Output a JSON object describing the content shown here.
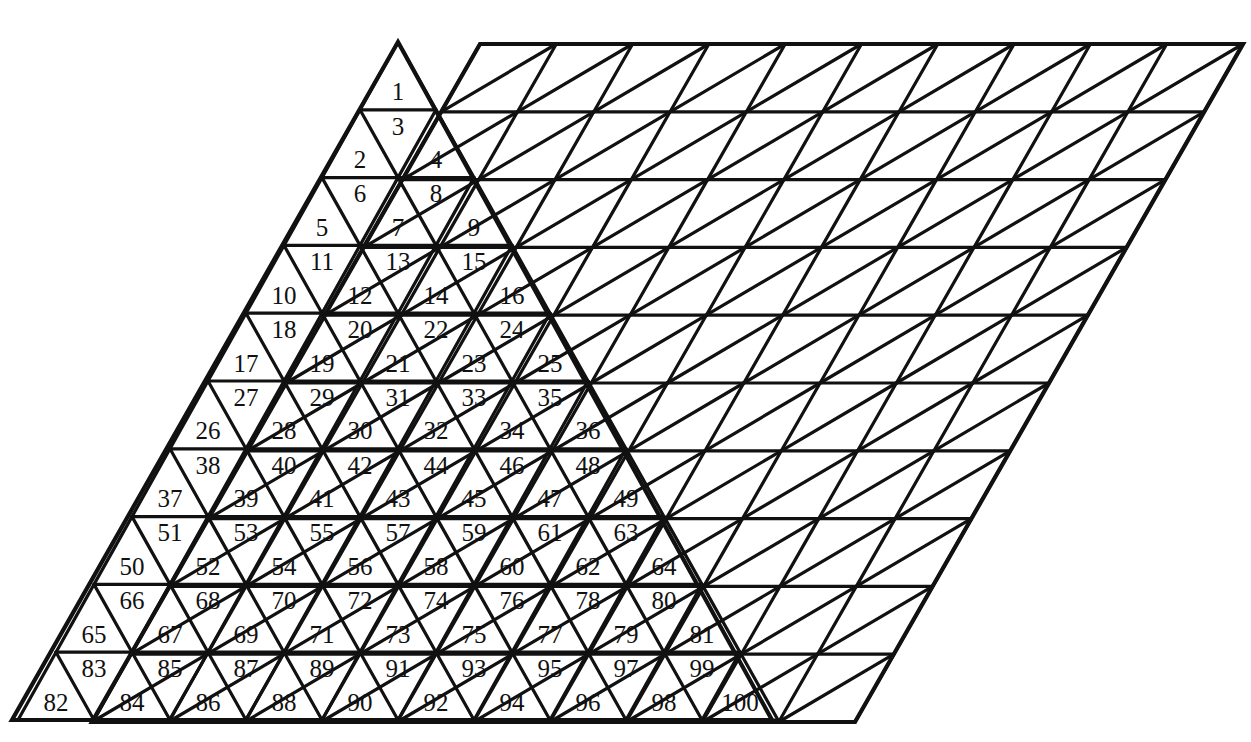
{
  "figure": {
    "background_color": "#ffffff",
    "line_color": "#111111"
  },
  "left_shape": {
    "name": "numbered-triangle",
    "type": "upward-triangle",
    "rows": 10,
    "apex": {
      "x": 398,
      "y": 42
    },
    "bottom_left": {
      "x": 12,
      "y": 720
    },
    "bottom_right": {
      "x": 772,
      "y": 720
    },
    "row_height": 67.8,
    "cell_half_width": 38.6,
    "total_cells": 100,
    "numbering": "left-to-right, top-to-bottom, upward and downward triangles alternating",
    "rows_data": [
      {
        "row": 1,
        "count": 1,
        "numbers": [
          1
        ]
      },
      {
        "row": 2,
        "count": 3,
        "numbers": [
          2,
          3,
          4
        ]
      },
      {
        "row": 3,
        "count": 5,
        "numbers": [
          5,
          6,
          7,
          8,
          9
        ]
      },
      {
        "row": 4,
        "count": 7,
        "numbers": [
          10,
          11,
          12,
          13,
          14,
          15,
          16
        ]
      },
      {
        "row": 5,
        "count": 9,
        "numbers": [
          17,
          18,
          19,
          20,
          21,
          22,
          23,
          24,
          25
        ]
      },
      {
        "row": 6,
        "count": 11,
        "numbers": [
          26,
          27,
          28,
          29,
          30,
          31,
          32,
          33,
          34,
          35,
          36
        ]
      },
      {
        "row": 7,
        "count": 13,
        "numbers": [
          37,
          38,
          39,
          40,
          41,
          42,
          43,
          44,
          45,
          46,
          47,
          48,
          49
        ]
      },
      {
        "row": 8,
        "count": 15,
        "numbers": [
          50,
          51,
          52,
          53,
          54,
          55,
          56,
          57,
          58,
          59,
          60,
          61,
          62,
          63,
          64
        ]
      },
      {
        "row": 9,
        "count": 17,
        "numbers": [
          65,
          66,
          67,
          68,
          69,
          70,
          71,
          72,
          73,
          74,
          75,
          76,
          77,
          78,
          79,
          80,
          81
        ]
      },
      {
        "row": 10,
        "count": 19,
        "numbers": [
          82,
          83,
          84,
          85,
          86,
          87,
          88,
          89,
          90,
          91,
          92,
          93,
          94,
          95,
          96,
          97,
          98,
          99,
          100
        ]
      }
    ]
  },
  "right_shape": {
    "name": "rhombus-grid",
    "type": "rhombus",
    "rows": 10,
    "columns": 10,
    "numbered": false,
    "top_left": {
      "x": 480,
      "y": 44
    },
    "top_right": {
      "x": 1243,
      "y": 44
    },
    "bottom_left": {
      "x": 92,
      "y": 722
    },
    "bottom_right": {
      "x": 855,
      "y": 722
    },
    "row_height": 67.8,
    "cell_half_width": 38.6,
    "total_cells": 200,
    "shear": "each successive row offset left by one half-cell-width"
  }
}
